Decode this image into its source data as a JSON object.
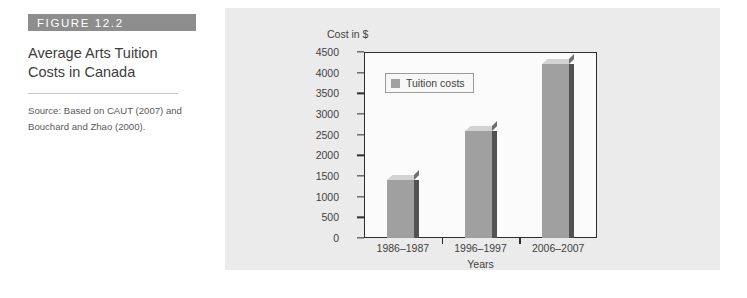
{
  "figure": {
    "banner_label": "FIGURE 12.2",
    "title": "Average Arts Tuition Costs in Canada",
    "source": "Source: Based on CAUT (2007) and Bouchard and Zhao (2000)."
  },
  "colors": {
    "banner_background": "#8d8d8d",
    "panel_background": "#ebebeb",
    "plot_background": "#fbfbfb",
    "bar_front": "#a0a0a0",
    "bar_top": "#d2d2d2",
    "bar_side": "#525252",
    "axis": "#2e2e2e",
    "text": "#3f3f3f"
  },
  "chart_data": {
    "type": "bar",
    "title": "",
    "xlabel": "Years",
    "ylabel": "Cost in $",
    "categories": [
      "1986–1987",
      "1996–1997",
      "2006–2007"
    ],
    "values": [
      1400,
      2580,
      4220
    ],
    "series": [
      {
        "name": "Tuition costs",
        "values": [
          1400,
          2580,
          4220
        ]
      }
    ],
    "ylim": [
      0,
      4500
    ],
    "ytick_step": 500,
    "yticks": [
      0,
      500,
      1000,
      1500,
      2000,
      2500,
      3000,
      3500,
      4000,
      4500
    ],
    "ytick_labels": [
      "0",
      "500",
      "1000",
      "1500",
      "2000",
      "2500",
      "3000",
      "3500",
      "4000",
      "4500"
    ],
    "grid": false,
    "legend": {
      "position": "top-left",
      "entries": [
        "Tuition costs"
      ]
    },
    "three_d": true
  }
}
